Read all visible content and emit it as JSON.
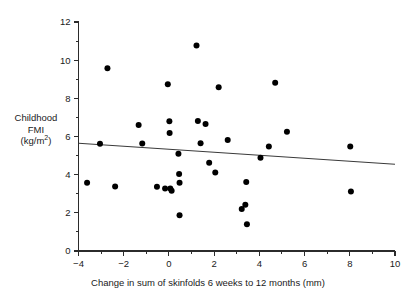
{
  "chart_data": {
    "type": "scatter",
    "title": "",
    "subtitle": "",
    "xlabel": "Change in sum of skinfolds 6 weeks to 12 months (mm)",
    "ylabel_lines": [
      "Childhood",
      "FMI",
      "(kg/m²)"
    ],
    "ylabel": "Childhood FMI (kg/m2)",
    "xlim": [
      -4,
      10
    ],
    "ylim": [
      0,
      12
    ],
    "x_ticks": [
      -4,
      -2,
      0,
      2,
      4,
      6,
      8,
      10
    ],
    "x_tick_labels": [
      "−4",
      "−2",
      "0",
      "2",
      "4",
      "6",
      "8",
      "10"
    ],
    "x_minor_step": 1,
    "y_ticks": [
      0,
      2,
      4,
      6,
      8,
      10,
      12
    ],
    "y_tick_labels": [
      "0",
      "2",
      "4",
      "6",
      "8",
      "10",
      "12"
    ],
    "y_minor_step": 1,
    "grid": false,
    "legend": false,
    "legend_position": "none",
    "marker": "filled-circle",
    "marker_color": "#000000",
    "marker_size_px": 4.0,
    "points": [
      {
        "x": -3.62,
        "y": 3.57
      },
      {
        "x": -3.05,
        "y": 5.62
      },
      {
        "x": -2.72,
        "y": 9.57
      },
      {
        "x": -2.38,
        "y": 3.38
      },
      {
        "x": -1.34,
        "y": 6.6
      },
      {
        "x": -1.18,
        "y": 5.63
      },
      {
        "x": -0.53,
        "y": 3.37
      },
      {
        "x": -0.17,
        "y": 3.28
      },
      {
        "x": -0.05,
        "y": 8.74
      },
      {
        "x": 0.02,
        "y": 6.8
      },
      {
        "x": 0.03,
        "y": 6.18
      },
      {
        "x": 0.06,
        "y": 3.28
      },
      {
        "x": 0.12,
        "y": 3.16
      },
      {
        "x": 0.42,
        "y": 5.1
      },
      {
        "x": 0.45,
        "y": 4.03
      },
      {
        "x": 0.47,
        "y": 3.58
      },
      {
        "x": 0.47,
        "y": 1.87
      },
      {
        "x": 1.22,
        "y": 10.77
      },
      {
        "x": 1.28,
        "y": 6.81
      },
      {
        "x": 1.4,
        "y": 5.65
      },
      {
        "x": 1.62,
        "y": 6.66
      },
      {
        "x": 1.78,
        "y": 4.62
      },
      {
        "x": 2.05,
        "y": 4.12
      },
      {
        "x": 2.2,
        "y": 8.58
      },
      {
        "x": 2.6,
        "y": 5.82
      },
      {
        "x": 3.22,
        "y": 2.2
      },
      {
        "x": 3.38,
        "y": 2.43
      },
      {
        "x": 3.42,
        "y": 3.62
      },
      {
        "x": 3.45,
        "y": 1.4
      },
      {
        "x": 4.05,
        "y": 4.88
      },
      {
        "x": 4.42,
        "y": 5.47
      },
      {
        "x": 4.7,
        "y": 8.82
      },
      {
        "x": 5.22,
        "y": 6.25
      },
      {
        "x": 8.02,
        "y": 5.47
      },
      {
        "x": 8.05,
        "y": 3.12
      }
    ],
    "trendline": {
      "type": "linear-fit",
      "x_start": -4,
      "y_start": 5.65,
      "x_end": 10,
      "y_end": 4.55,
      "slope": -0.0786,
      "intercept": 5.336,
      "color": "#3a3a3a"
    }
  }
}
